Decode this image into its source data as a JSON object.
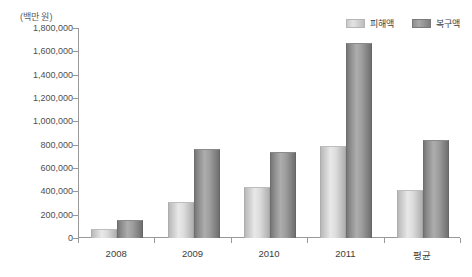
{
  "chart_data": {
    "type": "bar",
    "title": "",
    "subtitle": "",
    "unit_label": "(백만 원)",
    "xlabel": "",
    "ylabel": "",
    "categories": [
      "2008",
      "2009",
      "2010",
      "2011",
      "평균"
    ],
    "series": [
      {
        "name": "피해액",
        "color": "#d8d8d8",
        "values": [
          65000,
          300000,
          430000,
          780000,
          400000
        ]
      },
      {
        "name": "복구액",
        "color": "#9a9a9a",
        "values": [
          150000,
          755000,
          725000,
          1660000,
          830000
        ]
      }
    ],
    "ylim": [
      0,
      1800000
    ],
    "ytick_values": [
      0,
      200000,
      400000,
      600000,
      800000,
      1000000,
      1200000,
      1400000,
      1600000,
      1800000
    ],
    "ytick_labels": [
      "0",
      "200,000",
      "400,000",
      "600,000",
      "800,000",
      "1,000,000",
      "1,200,000",
      "1,400,000",
      "1,600,000",
      "1,800,000"
    ],
    "grid": false,
    "legend_position": "top-right",
    "legend_entries": [
      "피해액",
      "복구액"
    ]
  }
}
